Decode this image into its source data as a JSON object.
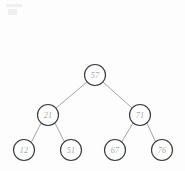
{
  "diagram": {
    "type": "binary-search-tree",
    "background_color": "#fdfdfd",
    "node_stroke_color": "#3a3a3a",
    "node_fill_color": "#fefefe",
    "label_color": "#a8a8a8",
    "edge_color": "#9a9a9a",
    "node_radius": 10.5,
    "nodes": [
      {
        "id": "root",
        "label": "57",
        "cx": 95,
        "cy": 75,
        "level": 0
      },
      {
        "id": "n-21",
        "label": "21",
        "cx": 48,
        "cy": 115,
        "level": 1
      },
      {
        "id": "n-71",
        "label": "71",
        "cx": 140,
        "cy": 115,
        "level": 1
      },
      {
        "id": "n-12",
        "label": "12",
        "cx": 24,
        "cy": 150,
        "level": 2
      },
      {
        "id": "n-51",
        "label": "51",
        "cx": 71,
        "cy": 150,
        "level": 2
      },
      {
        "id": "n-67",
        "label": "67",
        "cx": 115,
        "cy": 150,
        "level": 2
      },
      {
        "id": "n-76",
        "label": "76",
        "cx": 162,
        "cy": 150,
        "level": 2
      }
    ],
    "edges": [
      {
        "id": "e-57-21",
        "from": "root",
        "to": "n-21",
        "x1": 87,
        "y1": 82,
        "x2": 56,
        "y2": 108
      },
      {
        "id": "e-57-71",
        "from": "root",
        "to": "n-71",
        "x1": 103,
        "y1": 82,
        "x2": 132,
        "y2": 108
      },
      {
        "id": "e-21-12",
        "from": "n-21",
        "to": "n-12",
        "x1": 41,
        "y1": 123,
        "x2": 31,
        "y2": 143
      },
      {
        "id": "e-21-51",
        "from": "n-21",
        "to": "n-51",
        "x1": 55,
        "y1": 123,
        "x2": 65,
        "y2": 143
      },
      {
        "id": "e-71-67",
        "from": "n-71",
        "to": "n-67",
        "x1": 133,
        "y1": 123,
        "x2": 121,
        "y2": 143
      },
      {
        "id": "e-71-76",
        "from": "n-71",
        "to": "n-76",
        "x1": 147,
        "y1": 123,
        "x2": 156,
        "y2": 143
      }
    ]
  }
}
